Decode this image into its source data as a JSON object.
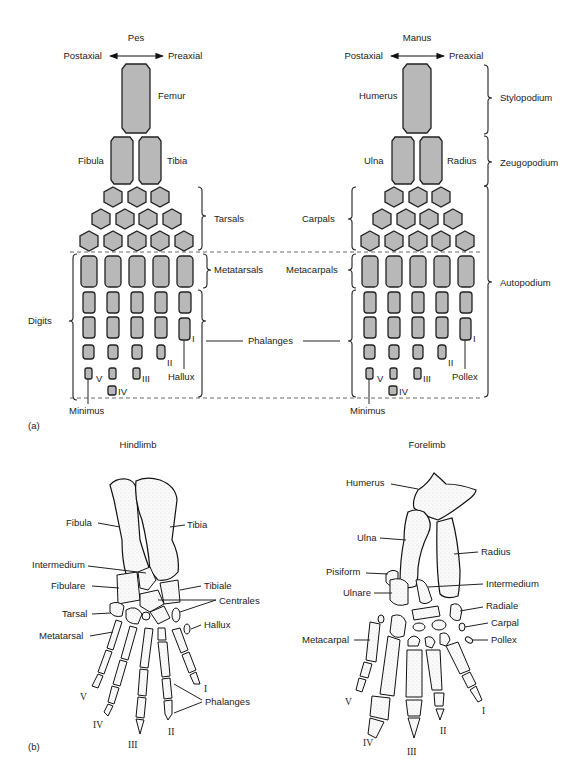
{
  "figure": {
    "panel_a_label": "(a)",
    "panel_b_label": "(b)"
  },
  "pes": {
    "title": "Pes",
    "postaxial": "Postaxial",
    "preaxial": "Preaxial",
    "femur": "Femur",
    "fibula": "Fibula",
    "tibia": "Tibia",
    "tarsals": "Tarsals",
    "metatarsals": "Metatarsals",
    "digits": "Digits",
    "hallux": "Hallux",
    "minimus": "Minimus",
    "digit_numerals": [
      "V",
      "IV",
      "III",
      "II",
      "I"
    ]
  },
  "shared": {
    "phalanges": "Phalanges"
  },
  "manus": {
    "title": "Manus",
    "postaxial": "Postaxial",
    "preaxial": "Preaxial",
    "humerus": "Humerus",
    "ulna": "Ulna",
    "radius": "Radius",
    "carpals": "Carpals",
    "metacarpals": "Metacarpals",
    "pollex": "Pollex",
    "minimus": "Minimus",
    "digit_numerals": [
      "V",
      "IV",
      "III",
      "II",
      "I"
    ],
    "segments": [
      "Stylopodium",
      "Zeugopodium",
      "Autopodium"
    ]
  },
  "hindlimb": {
    "title": "Hindlimb",
    "labels": {
      "fibula": "Fibula",
      "tibia": "Tibia",
      "intermedium": "Intermedium",
      "fibulare": "Fibulare",
      "tibiale": "Tibiale",
      "centrales": "Centrales",
      "tarsal": "Tarsal",
      "hallux": "Hallux",
      "metatarsal": "Metatarsal",
      "phalanges": "Phalanges"
    },
    "digit_numerals": [
      "V",
      "IV",
      "III",
      "II",
      "I"
    ]
  },
  "forelimb": {
    "title": "Forelimb",
    "labels": {
      "humerus": "Humerus",
      "ulna": "Ulna",
      "radius": "Radius",
      "pisiform": "Pisiform",
      "ulnare": "Ulnare",
      "intermedium": "Intermedium",
      "radiale": "Radiale",
      "carpal": "Carpal",
      "pollex": "Pollex",
      "metacarpal": "Metacarpal"
    },
    "digit_numerals": [
      "V",
      "IV",
      "III",
      "II",
      "I"
    ]
  },
  "colors": {
    "bone_fill": "#b8b8b8",
    "outline": "#222222",
    "background": "#ffffff"
  }
}
